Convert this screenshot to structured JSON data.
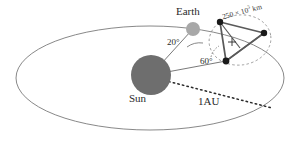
{
  "figure": {
    "type": "astronomy-orbit-diagram",
    "background_color": "#ffffff",
    "width": 300,
    "height": 141
  },
  "bodies": {
    "sun": {
      "label": "Sun",
      "color": "#6e6e6e",
      "cx": 151,
      "cy": 75,
      "r": 20
    },
    "earth": {
      "label": "Earth",
      "color": "#a8a8a8",
      "cx": 193,
      "cy": 29,
      "r": 7
    }
  },
  "orbit": {
    "name": "earth-orbit-ellipse",
    "color": "#7a7a7a",
    "cx": 150,
    "cy": 78,
    "rx": 134,
    "ry": 52
  },
  "radius_line": {
    "label": "1AU",
    "style": "dotted",
    "color": "#2a2a2a"
  },
  "angles": [
    {
      "name": "angle-earth",
      "label": "20°",
      "value": 20,
      "unit": "degrees"
    },
    {
      "name": "angle-constellation",
      "label": "60°",
      "value": 60,
      "unit": "degrees"
    }
  ],
  "constellation": {
    "name": "satellite-triangle",
    "distance_label_prefix": "250 × 10",
    "distance_label_exponent": "3",
    "distance_label_suffix": " km",
    "edge_color": "#5a5a5a",
    "node_color": "#1a1a1a",
    "dashed_orbit_color": "#8a8a8a",
    "nodes": [
      {
        "name": "satellite-node-top-left",
        "cx": 220,
        "cy": 22
      },
      {
        "name": "satellite-node-right",
        "cx": 264,
        "cy": 33
      },
      {
        "name": "satellite-node-bottom",
        "cx": 226,
        "cy": 61
      }
    ],
    "center_marker": {
      "name": "barycenter-marker",
      "cx": 232,
      "cy": 42
    }
  }
}
